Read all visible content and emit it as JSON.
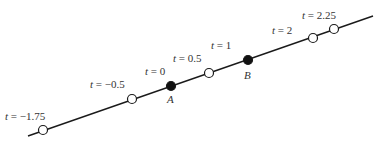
{
  "diagram": {
    "type": "parametric-line",
    "line": {
      "x1": 28,
      "y1": 136,
      "x2": 373,
      "y2": 16,
      "color": "#1a1a1a"
    },
    "points": [
      {
        "t_label": "t = −1.75",
        "t": -1.75,
        "cx": 43,
        "cy": 130,
        "filled": false,
        "lx": 5,
        "ly": 120,
        "name": ""
      },
      {
        "t_label": "t = −0.5",
        "t": -0.5,
        "cx": 132,
        "cy": 99,
        "filled": false,
        "lx": 90,
        "ly": 88,
        "name": ""
      },
      {
        "t_label": "t = 0",
        "t": 0,
        "cx": 171,
        "cy": 86,
        "filled": true,
        "lx": 145,
        "ly": 75,
        "name": "A",
        "nx": 167,
        "ny": 103
      },
      {
        "t_label": "t = 0.5",
        "t": 0.5,
        "cx": 209,
        "cy": 73,
        "filled": false,
        "lx": 173,
        "ly": 62,
        "name": ""
      },
      {
        "t_label": "t = 1",
        "t": 1,
        "cx": 248,
        "cy": 60,
        "filled": true,
        "lx": 211,
        "ly": 49,
        "name": "B",
        "nx": 244,
        "ny": 79
      },
      {
        "t_label": "t = 2",
        "t": 2,
        "cx": 313,
        "cy": 38,
        "filled": false,
        "lx": 272,
        "ly": 34,
        "name": ""
      },
      {
        "t_label": "t = 2.25",
        "t": 2.25,
        "cx": 334,
        "cy": 29,
        "filled": false,
        "lx": 302,
        "ly": 19,
        "name": ""
      }
    ],
    "point_radius": 4.5,
    "open_fill": "#ffffff",
    "filled_fill": "#111111",
    "stroke": "#1a1a1a"
  }
}
